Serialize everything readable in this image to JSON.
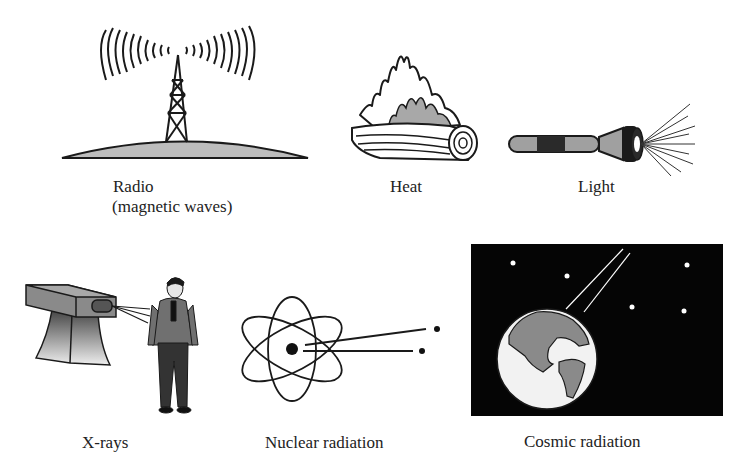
{
  "figure": {
    "panels": [
      {
        "id": "radio",
        "label": "Radio",
        "sublabel": "(magnetic waves)",
        "icon": "radio-tower-icon"
      },
      {
        "id": "heat",
        "label": "Heat",
        "icon": "burning-log-icon"
      },
      {
        "id": "light",
        "label": "Light",
        "icon": "flashlight-icon"
      },
      {
        "id": "xrays",
        "label": "X-rays",
        "icon": "xray-machine-icon"
      },
      {
        "id": "nuclear",
        "label": "Nuclear radiation",
        "icon": "atom-icon"
      },
      {
        "id": "cosmic",
        "label": "Cosmic radiation",
        "icon": "earth-in-space-icon"
      }
    ],
    "colors": {
      "line": "#1a1a1a",
      "gray_fill": "#9a9a9a",
      "light_gray": "#c8c8c8",
      "space": "#050505",
      "background": "#ffffff"
    }
  }
}
